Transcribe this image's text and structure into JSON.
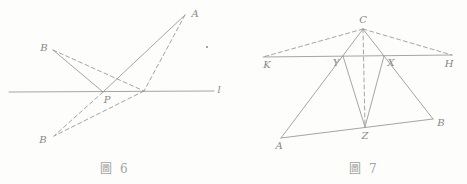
{
  "style": {
    "line_color": "#9b9b99",
    "label_color": "#888886",
    "caption_color": "#a2a2a0",
    "background": "#fdfdfc",
    "dash_pattern": "4 3",
    "stroke_width": 0.9
  },
  "figures": [
    {
      "id": "fig6",
      "caption": "圖 6",
      "description": "reflection-shortest-path-figure",
      "points": {
        "A": [
          185,
          15
        ],
        "B": [
          53,
          50
        ],
        "P": [
          103,
          92
        ],
        "Q": [
          144,
          91
        ],
        "B2": [
          54,
          136
        ],
        "L1": [
          9,
          92
        ],
        "L2": [
          214,
          91
        ]
      },
      "solid_segments": [
        [
          "L1",
          "L2"
        ],
        [
          "B",
          "P"
        ],
        [
          "P",
          "A"
        ]
      ],
      "dashed_segments": [
        [
          "B",
          "Q"
        ],
        [
          "A",
          "Q"
        ],
        [
          "Q",
          "B2"
        ],
        [
          "P",
          "B2"
        ]
      ],
      "labels": [
        {
          "text": "B",
          "x": 44,
          "y": 51
        },
        {
          "text": "A",
          "x": 195,
          "y": 17
        },
        {
          "text": "P",
          "x": 107,
          "y": 103
        },
        {
          "text": "B",
          "x": 43,
          "y": 143
        },
        {
          "text": "l",
          "x": 219,
          "y": 93
        }
      ],
      "dots": [
        [
          207,
          47
        ]
      ]
    },
    {
      "id": "fig7",
      "caption": "圖 7",
      "description": "triangle-with-transversal-figure",
      "points": {
        "C": [
          363,
          29
        ],
        "K": [
          263,
          57
        ],
        "H": [
          452,
          55
        ],
        "Y": [
          343,
          56
        ],
        "X": [
          384,
          56
        ],
        "Z": [
          365,
          127
        ],
        "A": [
          281,
          138
        ],
        "B": [
          433,
          119
        ]
      },
      "solid_segments": [
        [
          "K",
          "H"
        ],
        [
          "A",
          "C"
        ],
        [
          "B",
          "C"
        ],
        [
          "A",
          "B"
        ],
        [
          "Y",
          "Z"
        ],
        [
          "X",
          "Z"
        ]
      ],
      "dashed_segments": [
        [
          "C",
          "K"
        ],
        [
          "C",
          "H"
        ],
        [
          "C",
          "Z"
        ]
      ],
      "labels": [
        {
          "text": "C",
          "x": 363,
          "y": 23
        },
        {
          "text": "K",
          "x": 267,
          "y": 68
        },
        {
          "text": "H",
          "x": 449,
          "y": 67
        },
        {
          "text": "Y",
          "x": 336,
          "y": 66
        },
        {
          "text": "X",
          "x": 391,
          "y": 66
        },
        {
          "text": "Z",
          "x": 365,
          "y": 139
        },
        {
          "text": "A",
          "x": 279,
          "y": 149
        },
        {
          "text": "B",
          "x": 441,
          "y": 126
        }
      ],
      "dots": []
    }
  ]
}
